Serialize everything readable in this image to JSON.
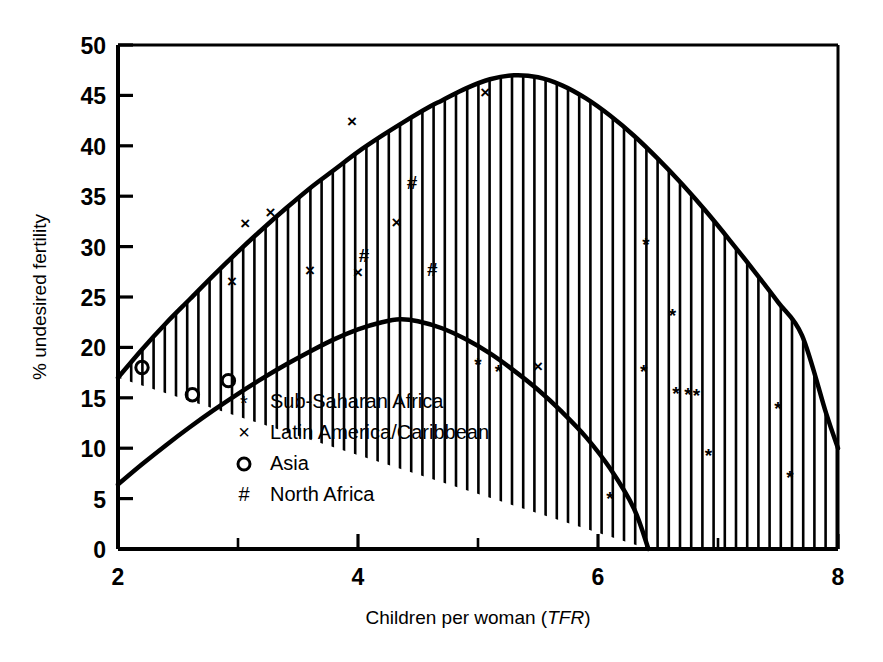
{
  "chart_data": {
    "type": "scatter",
    "title": "",
    "xlabel": "Children per woman (TFR)",
    "xlabel_plain": "Children per woman (",
    "xlabel_italic": "TFR",
    "xlabel_close": ")",
    "ylabel": "% undesired fertility",
    "xlim": [
      2,
      8
    ],
    "ylim": [
      0,
      50
    ],
    "grid": false,
    "legend_position": "inside-lower-left",
    "x_major_ticks": [
      2,
      4,
      6,
      8
    ],
    "x_minor_ticks": [
      3,
      5,
      7
    ],
    "x_tick_labels": [
      "2",
      "4",
      "6",
      "8"
    ],
    "y_ticks": [
      0,
      5,
      10,
      15,
      20,
      25,
      30,
      35,
      40,
      45,
      50
    ],
    "y_tick_labels": [
      "0",
      "5",
      "10",
      "15",
      "20",
      "25",
      "30",
      "35",
      "40",
      "45",
      "50"
    ],
    "legend": [
      {
        "marker": "*",
        "marker_name": "asterisk-marker",
        "label": "Sub-Saharan Africa"
      },
      {
        "marker": "×",
        "marker_name": "cross-marker",
        "label": "Latin America/Caribbean"
      },
      {
        "marker": "○",
        "marker_name": "circle-marker",
        "label": "Asia"
      },
      {
        "marker": "#",
        "marker_name": "hash-marker",
        "label": "North Africa"
      }
    ],
    "bands": {
      "name": "undesired-fertility-envelope",
      "description": "Hatched band between upper and lower fitted curves",
      "upper_curve": [
        [
          2.0,
          17.0
        ],
        [
          2.2,
          19.8
        ],
        [
          2.4,
          22.4
        ],
        [
          2.6,
          24.8
        ],
        [
          2.8,
          27.2
        ],
        [
          3.0,
          29.5
        ],
        [
          3.2,
          31.7
        ],
        [
          3.4,
          33.8
        ],
        [
          3.6,
          35.8
        ],
        [
          3.8,
          37.6
        ],
        [
          4.0,
          39.4
        ],
        [
          4.2,
          41.0
        ],
        [
          4.4,
          42.5
        ],
        [
          4.6,
          43.9
        ],
        [
          4.7,
          44.5
        ],
        [
          4.9,
          45.7
        ],
        [
          5.1,
          46.6
        ],
        [
          5.3,
          47.0
        ],
        [
          5.5,
          46.8
        ],
        [
          5.7,
          46.0
        ],
        [
          5.9,
          44.7
        ],
        [
          6.1,
          43.0
        ],
        [
          6.3,
          41.0
        ],
        [
          6.5,
          38.7
        ],
        [
          6.7,
          36.2
        ],
        [
          6.9,
          33.5
        ],
        [
          7.1,
          30.6
        ],
        [
          7.3,
          27.6
        ],
        [
          7.5,
          24.5
        ],
        [
          7.7,
          21.2
        ],
        [
          7.9,
          13.5
        ],
        [
          8.0,
          10.0
        ]
      ],
      "lower_curve": [
        [
          2.0,
          6.4
        ],
        [
          2.2,
          8.4
        ],
        [
          2.4,
          10.3
        ],
        [
          2.6,
          12.1
        ],
        [
          2.8,
          13.8
        ],
        [
          3.0,
          15.4
        ],
        [
          3.2,
          16.9
        ],
        [
          3.4,
          18.3
        ],
        [
          3.6,
          19.6
        ],
        [
          3.8,
          20.8
        ],
        [
          4.0,
          21.8
        ],
        [
          4.2,
          22.5
        ],
        [
          4.35,
          22.8
        ],
        [
          4.5,
          22.6
        ],
        [
          4.7,
          21.9
        ],
        [
          4.9,
          20.8
        ],
        [
          5.1,
          19.4
        ],
        [
          5.3,
          17.7
        ],
        [
          5.5,
          15.8
        ],
        [
          5.7,
          13.6
        ],
        [
          5.9,
          11.1
        ],
        [
          6.1,
          8.0
        ],
        [
          6.3,
          4.0
        ],
        [
          6.42,
          0.0
        ]
      ]
    },
    "series": [
      {
        "name": "Sub-Saharan Africa",
        "marker": "*",
        "points": [
          [
            5.0,
            18.5
          ],
          [
            5.17,
            17.8
          ],
          [
            6.1,
            5.2
          ],
          [
            6.38,
            17.8
          ],
          [
            6.4,
            30.4
          ],
          [
            6.62,
            23.3
          ],
          [
            6.65,
            15.6
          ],
          [
            6.75,
            15.5
          ],
          [
            6.82,
            15.4
          ],
          [
            6.92,
            9.4
          ],
          [
            7.5,
            14.1
          ],
          [
            7.6,
            7.2
          ]
        ]
      },
      {
        "name": "Latin America/Caribbean",
        "marker": "×",
        "points": [
          [
            2.95,
            26.7
          ],
          [
            3.06,
            32.4
          ],
          [
            3.27,
            33.5
          ],
          [
            3.6,
            27.8
          ],
          [
            3.95,
            42.6
          ],
          [
            4.0,
            27.6
          ],
          [
            4.32,
            32.5
          ],
          [
            5.06,
            45.4
          ],
          [
            5.5,
            18.3
          ]
        ]
      },
      {
        "name": "Asia",
        "marker": "○",
        "points": [
          [
            2.2,
            18.0
          ],
          [
            2.62,
            15.3
          ],
          [
            2.92,
            16.7
          ]
        ]
      },
      {
        "name": "North Africa",
        "marker": "#",
        "points": [
          [
            4.05,
            29.2
          ],
          [
            4.45,
            36.4
          ],
          [
            4.62,
            27.8
          ]
        ]
      }
    ]
  }
}
